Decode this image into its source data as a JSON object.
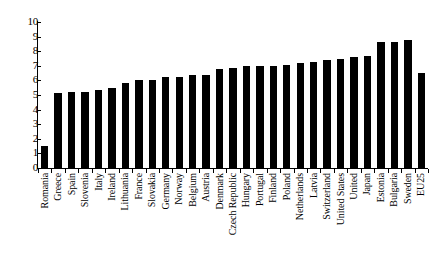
{
  "chart_data": {
    "type": "bar",
    "title": "",
    "subtitle": "",
    "xlabel": "",
    "ylabel": "",
    "ylim": [
      0,
      10
    ],
    "yticks": [
      0,
      1,
      2,
      3,
      4,
      5,
      6,
      7,
      8,
      9,
      10
    ],
    "ytick_labels": [
      "0",
      "1",
      "2",
      "3",
      "4",
      "5",
      "6",
      "7",
      "8",
      "9",
      "10"
    ],
    "grid": false,
    "legend": null,
    "bar_color": "#000000",
    "categories": [
      "Romania",
      "Greece",
      "Spain",
      "Slovenia",
      "Italy",
      "Ireland",
      "Lithuania",
      "France",
      "Slovakia",
      "Germany",
      "Norway",
      "Belgium",
      "Austria",
      "Denmark",
      "Czech Republic",
      "Hungary",
      "Portugal",
      "Finland",
      "Poland",
      "Netherlands",
      "Latvia",
      "Switzerland",
      "United States",
      "United",
      "Japan",
      "Estonia",
      "Bulgaria",
      "Sweden",
      "EU25"
    ],
    "values": [
      1.5,
      5.15,
      5.2,
      5.2,
      5.35,
      5.45,
      5.85,
      6.05,
      6.05,
      6.25,
      6.25,
      6.4,
      6.4,
      6.75,
      6.85,
      7.0,
      7.0,
      7.0,
      7.05,
      7.2,
      7.25,
      7.4,
      7.5,
      7.6,
      7.7,
      8.6,
      8.65,
      8.75,
      6.5
    ]
  }
}
